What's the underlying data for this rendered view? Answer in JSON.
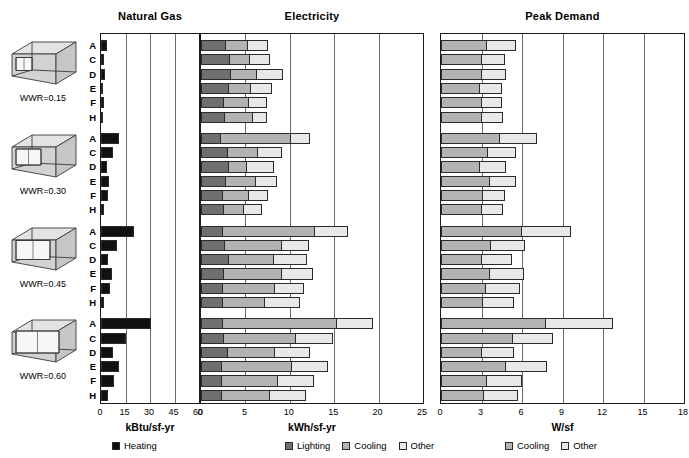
{
  "figure": {
    "background": "#ffffff",
    "row_labels": [
      "A",
      "C",
      "D",
      "E",
      "F",
      "H"
    ],
    "groups": [
      {
        "wwr_label": "WWR=0.15"
      },
      {
        "wwr_label": "WWR=0.30"
      },
      {
        "wwr_label": "WWR=0.45"
      },
      {
        "wwr_label": "WWR=0.60"
      }
    ]
  },
  "colors": {
    "heating": "#111111",
    "lighting": "#6f6f6f",
    "cooling": "#b3b3b3",
    "other": "#e8e8e8",
    "frame": "#1a1a1a",
    "grid": "#6a6a6a"
  },
  "chart_data": [
    {
      "type": "bar",
      "title": "Natural Gas",
      "xlabel": "kBtu/sf-yr",
      "ylabel": "",
      "xlim": [
        0,
        60
      ],
      "xticks": [
        0,
        15,
        30,
        45,
        60
      ],
      "grid": true,
      "legend": [
        {
          "label": "Heating",
          "color": "#111111"
        }
      ],
      "categories": [
        "A",
        "C",
        "D",
        "E",
        "F",
        "H"
      ],
      "groups": [
        "WWR=0.15",
        "WWR=0.30",
        "WWR=0.45",
        "WWR=0.60"
      ],
      "series": [
        {
          "name": "Heating",
          "values": [
            [
              3.4,
              2.0,
              2.2,
              1.4,
              1.7,
              1.4
            ],
            [
              11.2,
              7.4,
              3.8,
              4.6,
              4.0,
              1.8
            ],
            [
              20.4,
              9.8,
              4.4,
              6.8,
              5.4,
              2.0
            ],
            [
              30.4,
              15.0,
              7.2,
              11.2,
              8.0,
              4.0
            ]
          ]
        }
      ]
    },
    {
      "type": "bar",
      "title": "Electricity",
      "xlabel": "kWh/sf-yr",
      "ylabel": "",
      "xlim": [
        0,
        25
      ],
      "xticks": [
        0,
        5,
        10,
        15,
        20,
        25
      ],
      "grid": true,
      "stacked": true,
      "legend": [
        {
          "label": "Lighting",
          "color": "#6f6f6f"
        },
        {
          "label": "Cooling",
          "color": "#b3b3b3"
        },
        {
          "label": "Other",
          "color": "#e8e8e8"
        }
      ],
      "categories": [
        "A",
        "C",
        "D",
        "E",
        "F",
        "H"
      ],
      "groups": [
        "WWR=0.15",
        "WWR=0.30",
        "WWR=0.45",
        "WWR=0.60"
      ],
      "series": [
        {
          "name": "Lighting",
          "values": [
            [
              2.8,
              3.3,
              3.4,
              3.2,
              2.6,
              2.7
            ],
            [
              2.2,
              3.0,
              3.2,
              2.8,
              2.5,
              2.6
            ],
            [
              2.5,
              2.7,
              3.2,
              2.6,
              2.5,
              2.5
            ],
            [
              2.5,
              2.6,
              3.0,
              2.4,
              2.4,
              2.4
            ]
          ]
        },
        {
          "name": "Cooling",
          "values": [
            [
              2.6,
              2.3,
              3.0,
              2.6,
              2.9,
              3.3
            ],
            [
              8.1,
              3.5,
              2.1,
              3.5,
              3.0,
              2.4
            ],
            [
              10.5,
              6.5,
              5.1,
              6.6,
              5.9,
              4.8
            ],
            [
              12.9,
              8.2,
              5.4,
              8.0,
              6.4,
              5.5
            ]
          ]
        },
        {
          "name": "Other",
          "values": [
            [
              2.4,
              2.4,
              3.1,
              2.4,
              2.2,
              1.7
            ],
            [
              2.2,
              2.8,
              3.1,
              2.5,
              2.3,
              2.1
            ],
            [
              3.8,
              3.2,
              3.9,
              3.6,
              3.4,
              4.1
            ],
            [
              4.2,
              4.3,
              4.1,
              4.1,
              4.2,
              4.2
            ]
          ]
        }
      ]
    },
    {
      "type": "bar",
      "title": "Peak Demand",
      "xlabel": "W/sf",
      "ylabel": "",
      "xlim": [
        0,
        18
      ],
      "xticks": [
        0,
        3,
        6,
        9,
        12,
        15,
        18
      ],
      "grid": true,
      "stacked": true,
      "legend": [
        {
          "label": "Cooling",
          "color": "#b3b3b3"
        },
        {
          "label": "Other",
          "color": "#e8e8e8"
        }
      ],
      "categories": [
        "A",
        "C",
        "D",
        "E",
        "F",
        "H"
      ],
      "groups": [
        "WWR=0.15",
        "WWR=0.30",
        "WWR=0.45",
        "WWR=0.60"
      ],
      "series": [
        {
          "name": "Cooling",
          "values": [
            [
              3.4,
              3.0,
              3.0,
              2.9,
              3.0,
              3.0
            ],
            [
              4.4,
              3.5,
              2.9,
              3.6,
              3.1,
              3.0
            ],
            [
              6.0,
              3.7,
              3.0,
              3.6,
              3.3,
              3.1
            ],
            [
              7.8,
              5.3,
              3.0,
              4.8,
              3.4,
              3.2
            ]
          ]
        },
        {
          "name": "Other",
          "values": [
            [
              2.2,
              1.8,
              1.9,
              1.7,
              1.6,
              1.7
            ],
            [
              2.8,
              2.1,
              2.0,
              2.0,
              1.7,
              1.7
            ],
            [
              3.7,
              2.6,
              2.3,
              2.6,
              2.6,
              2.4
            ],
            [
              5.0,
              3.1,
              2.5,
              3.1,
              2.7,
              2.6
            ]
          ]
        }
      ]
    }
  ],
  "legends": {
    "natural_gas": [
      {
        "label": "Heating",
        "swatch": "#111111"
      }
    ],
    "electricity": [
      {
        "label": "Lighting",
        "swatch": "#6f6f6f"
      },
      {
        "label": "Cooling",
        "swatch": "#b3b3b3"
      },
      {
        "label": "Other",
        "swatch": "#e8e8e8"
      }
    ],
    "peak_demand": [
      {
        "label": "Cooling",
        "swatch": "#b3b3b3"
      },
      {
        "label": "Other",
        "swatch": "#e8e8e8"
      }
    ]
  }
}
